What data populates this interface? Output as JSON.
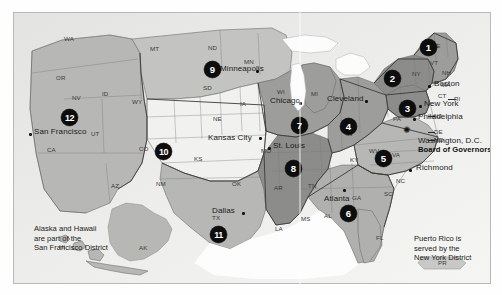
{
  "map": {
    "title": "Federal Reserve Districts",
    "frame": {
      "border_color": "#b9b9b6",
      "background_color": "#e8e8e6"
    },
    "marker_color": "#0d0d0d",
    "marker_text_color": "#ffffff"
  },
  "districts": [
    {
      "number": "1",
      "city": "Boston"
    },
    {
      "number": "2",
      "city": "New York"
    },
    {
      "number": "3",
      "city": "Philadelphia"
    },
    {
      "number": "4",
      "city": "Cleveland"
    },
    {
      "number": "5",
      "city": "Richmond"
    },
    {
      "number": "6",
      "city": "Atlanta"
    },
    {
      "number": "7",
      "city": "Chicago"
    },
    {
      "number": "8",
      "city": "St. Louis"
    },
    {
      "number": "9",
      "city": "Minneapolis"
    },
    {
      "number": "10",
      "city": "Kansas City"
    },
    {
      "number": "11",
      "city": "Dallas"
    },
    {
      "number": "12",
      "city": "San Francisco"
    }
  ],
  "cities": [
    {
      "name": "Boston"
    },
    {
      "name": "New York"
    },
    {
      "name": "Philadelphia"
    },
    {
      "name": "Washington, D.C."
    },
    {
      "name": "Board of Governors"
    },
    {
      "name": "Richmond"
    },
    {
      "name": "Atlanta"
    },
    {
      "name": "Cleveland"
    },
    {
      "name": "Chicago"
    },
    {
      "name": "St. Louis"
    },
    {
      "name": "Minneapolis"
    },
    {
      "name": "Kansas City"
    },
    {
      "name": "Dallas"
    },
    {
      "name": "San Francisco"
    }
  ],
  "states": [
    "WA",
    "OR",
    "ID",
    "MT",
    "ND",
    "SD",
    "MN",
    "WI",
    "MI",
    "ME",
    "VT",
    "NH",
    "NY",
    "MA",
    "CT",
    "RI",
    "PA",
    "NJ",
    "DE",
    "MD",
    "OH",
    "IN",
    "IL",
    "IA",
    "NE",
    "WY",
    "NV",
    "UT",
    "CO",
    "KS",
    "MO",
    "KY",
    "WV",
    "VA",
    "NC",
    "SC",
    "GA",
    "FL",
    "AL",
    "MS",
    "TN",
    "AR",
    "LA",
    "TX",
    "OK",
    "NM",
    "AZ",
    "CA",
    "AK",
    "HI",
    "PR"
  ],
  "state_labels": {
    "WA": "WA",
    "OR": "OR",
    "ID": "ID",
    "MT": "MT",
    "ND": "ND",
    "SD": "SD",
    "MN": "MN",
    "WI": "WI",
    "MI": "MI",
    "ME": "ME",
    "VT": "VT",
    "NH": "NH",
    "NY": "NY",
    "MA": "MA",
    "CT": "CT",
    "RI": "RI",
    "PA": "PA",
    "NJ": "NJ",
    "DE": "DE",
    "MD": "MD",
    "OH": "OH",
    "IN": "IN",
    "IL": "IL",
    "IA": "IA",
    "NE": "NE",
    "WY": "WY",
    "NV": "NV",
    "UT": "UT",
    "CO": "CO",
    "KS": "KS",
    "MO": "MO",
    "KY": "KY",
    "WV": "WV",
    "VA": "VA",
    "NC": "NC",
    "SC": "SC",
    "GA": "GA",
    "FL": "FL",
    "AL": "AL",
    "MS": "MS",
    "TN": "TN",
    "AR": "AR",
    "LA": "LA",
    "TX": "TX",
    "OK": "OK",
    "NM": "NM",
    "AZ": "AZ",
    "CA": "CA",
    "AK": "AK",
    "HI": "HI",
    "PR": "PR"
  },
  "notes": {
    "alaska_hawaii": "Alaska and Hawaii\nare part of the\nSan Francisco District",
    "alaska_hawaii_line1": "Alaska and Hawaii",
    "alaska_hawaii_line2": "are part of the",
    "alaska_hawaii_line3": "San Francisco District",
    "puerto_rico_line1": "Puerto Rico is",
    "puerto_rico_line2": "served by the",
    "puerto_rico_line3": "New York District"
  },
  "markers": {
    "m1": "1",
    "m2": "2",
    "m3": "3",
    "m4": "4",
    "m5": "5",
    "m6": "6",
    "m7": "7",
    "m8": "8",
    "m9": "9",
    "m10": "10",
    "m11": "11",
    "m12": "12"
  },
  "board": {
    "label": "Board of Governors",
    "city": "Washington, D.C.",
    "symbol": "star-marker"
  }
}
